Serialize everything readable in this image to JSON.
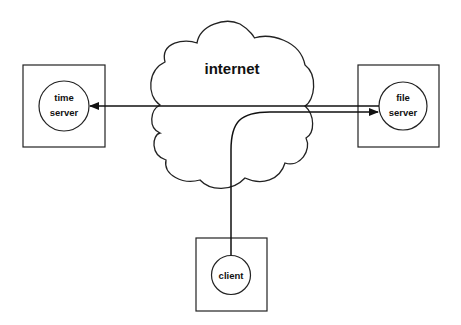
{
  "diagram": {
    "cloud_label": "internet",
    "nodes": {
      "time_server": {
        "line1": "time",
        "line2": "server"
      },
      "file_server": {
        "line1": "file",
        "line2": "server"
      },
      "client": {
        "label": "client"
      }
    },
    "edges": [
      {
        "from": "file server",
        "to": "time server",
        "style": "straight"
      },
      {
        "from": "client",
        "to": "file server",
        "style": "curved"
      }
    ],
    "colors": {
      "stroke": "#111111",
      "background": "#ffffff"
    }
  }
}
